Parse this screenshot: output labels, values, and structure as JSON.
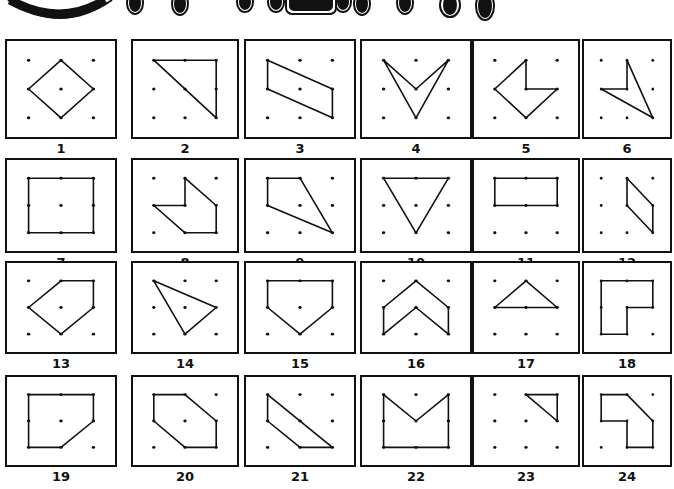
{
  "title": {
    "text": "GEOBOARD",
    "visible": "partial (bubble letters cut off at top)"
  },
  "layout": {
    "rows": 4,
    "cols": 6,
    "grid": "3x3 dots per board"
  },
  "colors": {
    "ink": "#111111",
    "paper": "#ffffff"
  },
  "boards": [
    {
      "label": "1",
      "shape": [
        [
          1,
          0
        ],
        [
          2,
          1
        ],
        [
          1,
          2
        ],
        [
          0,
          1
        ]
      ]
    },
    {
      "label": "2",
      "shape": [
        [
          0,
          0
        ],
        [
          2,
          0
        ],
        [
          2,
          2
        ]
      ]
    },
    {
      "label": "3",
      "shape": [
        [
          0,
          0
        ],
        [
          2,
          1
        ],
        [
          2,
          2
        ],
        [
          0,
          1
        ]
      ]
    },
    {
      "label": "4",
      "shape": [
        [
          0,
          0
        ],
        [
          1,
          1
        ],
        [
          2,
          0
        ],
        [
          1,
          2
        ]
      ]
    },
    {
      "label": "5",
      "shape": [
        [
          1,
          0
        ],
        [
          1,
          1
        ],
        [
          2,
          1
        ],
        [
          1,
          2
        ],
        [
          0,
          1
        ]
      ]
    },
    {
      "label": "6",
      "shape": [
        [
          1,
          0
        ],
        [
          2,
          2
        ],
        [
          0,
          1
        ],
        [
          1,
          1
        ]
      ]
    },
    {
      "label": "7",
      "shape": [
        [
          0,
          0
        ],
        [
          2,
          0
        ],
        [
          2,
          2
        ],
        [
          0,
          2
        ]
      ]
    },
    {
      "label": "8",
      "shape": [
        [
          1,
          0
        ],
        [
          2,
          1
        ],
        [
          2,
          2
        ],
        [
          1,
          2
        ],
        [
          0,
          1
        ],
        [
          1,
          1
        ]
      ]
    },
    {
      "label": "9",
      "shape": [
        [
          0,
          0
        ],
        [
          1,
          0
        ],
        [
          2,
          2
        ],
        [
          0,
          1
        ]
      ]
    },
    {
      "label": "10",
      "shape": [
        [
          0,
          0
        ],
        [
          2,
          0
        ],
        [
          1,
          2
        ]
      ]
    },
    {
      "label": "11",
      "shape": [
        [
          0,
          0
        ],
        [
          2,
          0
        ],
        [
          2,
          1
        ],
        [
          0,
          1
        ]
      ]
    },
    {
      "label": "12",
      "shape": [
        [
          1,
          0
        ],
        [
          2,
          1
        ],
        [
          2,
          2
        ],
        [
          1,
          1
        ]
      ]
    },
    {
      "label": "13",
      "shape": [
        [
          1,
          0
        ],
        [
          2,
          0
        ],
        [
          2,
          1
        ],
        [
          1,
          2
        ],
        [
          0,
          1
        ]
      ]
    },
    {
      "label": "14",
      "shape": [
        [
          0,
          0
        ],
        [
          2,
          1
        ],
        [
          1,
          2
        ]
      ]
    },
    {
      "label": "15",
      "shape": [
        [
          0,
          0
        ],
        [
          2,
          0
        ],
        [
          2,
          1
        ],
        [
          1,
          2
        ],
        [
          0,
          1
        ]
      ]
    },
    {
      "label": "16",
      "shape": [
        [
          1,
          0
        ],
        [
          2,
          1
        ],
        [
          2,
          2
        ],
        [
          1,
          1
        ],
        [
          0,
          2
        ],
        [
          0,
          1
        ]
      ]
    },
    {
      "label": "17",
      "shape": [
        [
          1,
          0
        ],
        [
          2,
          1
        ],
        [
          0,
          1
        ]
      ]
    },
    {
      "label": "18",
      "shape": [
        [
          0,
          0
        ],
        [
          2,
          0
        ],
        [
          2,
          1
        ],
        [
          1,
          1
        ],
        [
          1,
          2
        ],
        [
          0,
          2
        ]
      ]
    },
    {
      "label": "19",
      "shape": [
        [
          0,
          0
        ],
        [
          2,
          0
        ],
        [
          2,
          1
        ],
        [
          1,
          2
        ],
        [
          0,
          2
        ]
      ]
    },
    {
      "label": "20",
      "shape": [
        [
          0,
          0
        ],
        [
          1,
          0
        ],
        [
          2,
          1
        ],
        [
          2,
          2
        ],
        [
          1,
          2
        ],
        [
          0,
          1
        ]
      ]
    },
    {
      "label": "21",
      "shape": [
        [
          0,
          0
        ],
        [
          2,
          2
        ],
        [
          1,
          2
        ],
        [
          0,
          1
        ]
      ]
    },
    {
      "label": "22",
      "shape": [
        [
          0,
          0
        ],
        [
          1,
          1
        ],
        [
          2,
          0
        ],
        [
          2,
          2
        ],
        [
          0,
          2
        ]
      ]
    },
    {
      "label": "23",
      "shape": [
        [
          1,
          0
        ],
        [
          2,
          0
        ],
        [
          2,
          1
        ]
      ]
    },
    {
      "label": "24",
      "shape": [
        [
          0,
          0
        ],
        [
          1,
          0
        ],
        [
          2,
          1
        ],
        [
          2,
          2
        ],
        [
          1,
          2
        ],
        [
          1,
          1
        ],
        [
          0,
          1
        ]
      ]
    }
  ]
}
